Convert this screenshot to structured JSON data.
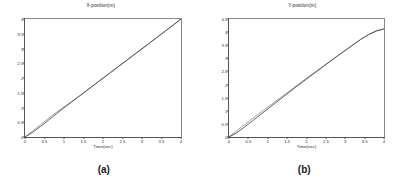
{
  "figure": {
    "panels": [
      {
        "id": "panel-a",
        "caption": "(a)",
        "chart_data": {
          "type": "line",
          "title": "X-position(m)",
          "xlabel": "Time(sec)",
          "ylabel": "",
          "xlim": [
            0,
            4
          ],
          "ylim": [
            0,
            4
          ],
          "grid": false,
          "legend": "none",
          "xticks": [
            "0",
            "0.5",
            "1",
            "1.5",
            "2",
            "2.5",
            "3",
            "3.5",
            "4"
          ],
          "xtickvalues": [
            0,
            0.5,
            1,
            1.5,
            2,
            2.5,
            3,
            3.5,
            4
          ],
          "yticks": [
            "0",
            "0.5",
            "1",
            "1.5",
            "2",
            "2.5",
            "3",
            "3.5",
            "4"
          ],
          "ytickvalues": [
            0,
            0.5,
            1,
            1.5,
            2,
            2.5,
            3,
            3.5,
            4
          ],
          "x": [
            0,
            0.2,
            0.4,
            0.6,
            0.8,
            1.0,
            1.2,
            1.4,
            1.6,
            1.8,
            2.0,
            2.2,
            2.4,
            2.6,
            2.8,
            3.0,
            3.2,
            3.4,
            3.6,
            3.8,
            4.0
          ],
          "series": [
            {
              "name": "reference",
              "color": "#8a8a8a",
              "values": [
                0,
                0.21,
                0.42,
                0.63,
                0.83,
                1.02,
                1.21,
                1.4,
                1.6,
                1.8,
                2.0,
                2.2,
                2.4,
                2.6,
                2.8,
                3.0,
                3.2,
                3.4,
                3.6,
                3.8,
                4.0
              ]
            },
            {
              "name": "actual",
              "color": "#3a3a3a",
              "values": [
                0,
                0.16,
                0.36,
                0.57,
                0.78,
                0.99,
                1.19,
                1.39,
                1.59,
                1.79,
                1.99,
                2.19,
                2.39,
                2.59,
                2.79,
                2.99,
                3.19,
                3.39,
                3.59,
                3.79,
                4.0
              ]
            }
          ]
        }
      },
      {
        "id": "panel-b",
        "caption": "(b)",
        "chart_data": {
          "type": "line",
          "title": "Y-position(m)",
          "xlabel": "Time(sec)",
          "ylabel": "",
          "xlim": [
            0,
            4
          ],
          "ylim": [
            0,
            4.5
          ],
          "grid": false,
          "legend": "none",
          "xticks": [
            "0",
            "0.5",
            "1",
            "1.5",
            "2",
            "2.5",
            "3",
            "3.5",
            "4"
          ],
          "xtickvalues": [
            0,
            0.5,
            1,
            1.5,
            2,
            2.5,
            3,
            3.5,
            4
          ],
          "yticks": [
            "0",
            "0.5",
            "1",
            "1.5",
            "2",
            "2.5",
            "3",
            "3.5",
            "4",
            "4.5"
          ],
          "ytickvalues": [
            0,
            0.5,
            1,
            1.5,
            2,
            2.5,
            3,
            3.5,
            4,
            4.5
          ],
          "x": [
            0,
            0.2,
            0.4,
            0.6,
            0.8,
            1.0,
            1.2,
            1.4,
            1.6,
            1.8,
            2.0,
            2.2,
            2.4,
            2.6,
            2.8,
            3.0,
            3.2,
            3.4,
            3.6,
            3.8,
            4.0
          ],
          "series": [
            {
              "name": "reference",
              "color": "#8a8a8a",
              "values": [
                0,
                0.24,
                0.47,
                0.7,
                0.92,
                1.14,
                1.36,
                1.58,
                1.8,
                2.02,
                2.24,
                2.45,
                2.67,
                2.88,
                3.1,
                3.31,
                3.52,
                3.73,
                3.91,
                4.05,
                4.13
              ]
            },
            {
              "name": "actual",
              "color": "#3a3a3a",
              "values": [
                0,
                0.16,
                0.38,
                0.61,
                0.84,
                1.07,
                1.3,
                1.53,
                1.76,
                1.99,
                2.21,
                2.43,
                2.65,
                2.87,
                3.09,
                3.3,
                3.51,
                3.72,
                3.9,
                4.04,
                4.12
              ]
            }
          ]
        }
      }
    ]
  }
}
